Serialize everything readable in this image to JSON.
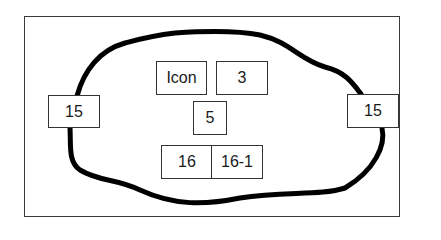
{
  "diagram": {
    "outline_color": "#333333",
    "loop_color": "#000000",
    "boxes": {
      "left_terminal": "15",
      "right_terminal": "15",
      "icon": "Icon",
      "three": "3",
      "five": "5",
      "sixteen": "16",
      "sixteen_one": "16-1"
    }
  }
}
